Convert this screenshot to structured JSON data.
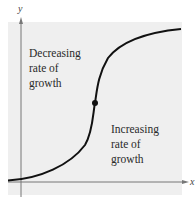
{
  "diagram": {
    "type": "logistic-curve",
    "axes": {
      "x_label": "x",
      "y_label": "y"
    },
    "annotations": [
      {
        "id": "upper",
        "lines": [
          "Decreasing",
          "rate of",
          "growth"
        ]
      },
      {
        "id": "lower",
        "lines": [
          "Increasing",
          "rate of",
          "growth"
        ]
      }
    ],
    "inflection_point": {
      "label": "",
      "marker": "filled-dot"
    },
    "colors": {
      "panel": "#efefef",
      "curve": "#111111",
      "axis": "#777777"
    }
  }
}
